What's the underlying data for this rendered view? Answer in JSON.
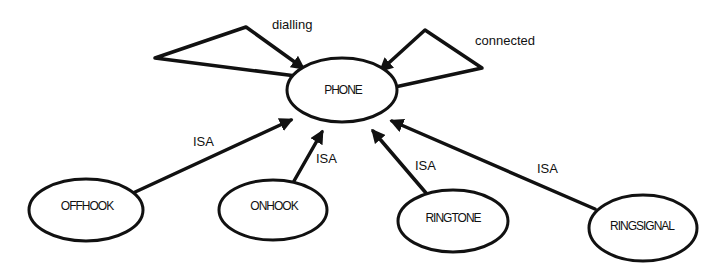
{
  "diagram": {
    "type": "semantic-network",
    "nodes": {
      "phone": {
        "label": "PHONE"
      },
      "offhook": {
        "label": "OFFHOOK"
      },
      "onhook": {
        "label": "ONHOOK"
      },
      "ringtone": {
        "label": "RINGTONE"
      },
      "ringsignal": {
        "label": "RINGSIGNAL"
      }
    },
    "edges": {
      "dialling": {
        "label": "dialling",
        "from": "PHONE",
        "to": "PHONE"
      },
      "connected": {
        "label": "connected",
        "from": "PHONE",
        "to": "PHONE"
      },
      "offhook_isa": {
        "label": "ISA",
        "from": "OFFHOOK",
        "to": "PHONE"
      },
      "onhook_isa": {
        "label": "ISA",
        "from": "ONHOOK",
        "to": "PHONE"
      },
      "ringtone_isa": {
        "label": "ISA",
        "from": "RINGTONE",
        "to": "PHONE"
      },
      "ringsignal_isa": {
        "label": "ISA",
        "from": "RINGSIGNAL",
        "to": "PHONE"
      }
    },
    "colors": {
      "stroke": "#111111",
      "background": "#ffffff"
    }
  }
}
